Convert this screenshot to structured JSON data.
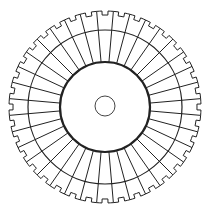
{
  "diagram": {
    "type": "notched-radial-disk",
    "width": 212,
    "height": 214,
    "center": [
      105,
      107
    ],
    "segments": 36,
    "outer_radius": 96,
    "notch_depth": 4,
    "notch_width_deg": 3.6,
    "middle_ring_radius": 77,
    "inner_ring_radius": 45,
    "hub_radius": 10,
    "stroke_color": "#222222",
    "background": "#ffffff"
  }
}
